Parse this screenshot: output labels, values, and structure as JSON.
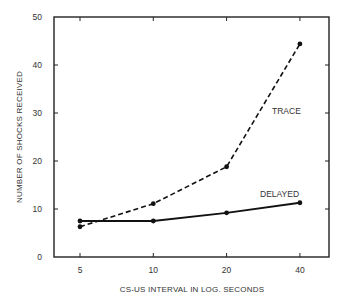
{
  "chart_data": {
    "type": "line",
    "title": "",
    "xlabel": "CS-US INTERVAL IN LOG. SECONDS",
    "ylabel": "NUMBER OF SHOCKS RECEIVED",
    "x_scale": "log",
    "x": [
      5,
      10,
      20,
      40
    ],
    "x_tick_labels": [
      "5",
      "10",
      "20",
      "40"
    ],
    "y_ticks": [
      0,
      10,
      20,
      30,
      40,
      50
    ],
    "y_tick_labels": [
      "0",
      "10",
      "20",
      "30",
      "40",
      "50"
    ],
    "ylim": [
      0,
      50
    ],
    "grid": false,
    "legend": "inline labels",
    "series": [
      {
        "name": "TRACE",
        "style": "dashed",
        "values": [
          6.3,
          11.1,
          18.8,
          44.4
        ]
      },
      {
        "name": "DELAYED",
        "style": "solid",
        "values": [
          7.5,
          7.5,
          9.2,
          11.3
        ]
      }
    ]
  },
  "colors": {
    "line": "#111111",
    "axis": "#222222",
    "text": "#333333",
    "background": "#ffffff"
  }
}
